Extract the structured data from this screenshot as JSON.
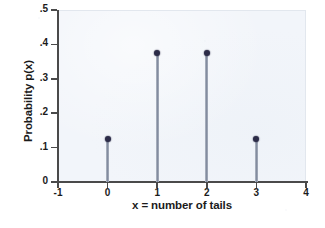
{
  "chart_data": {
    "type": "bar",
    "subtype": "stem-plot",
    "title": "",
    "xlabel": "x = number of tails",
    "ylabel": "Probability p(x)",
    "categories": [
      "0",
      "1",
      "2",
      "3"
    ],
    "x": [
      0,
      1,
      2,
      3
    ],
    "values": [
      0.125,
      0.375,
      0.375,
      0.125
    ],
    "xlim": [
      -1,
      4
    ],
    "ylim": [
      0,
      0.5
    ],
    "xticks": [
      -1,
      0,
      1,
      2,
      3,
      4
    ],
    "xtick_labels": [
      "-1",
      "0",
      "1",
      "2",
      "3",
      "4"
    ],
    "yticks": [
      0,
      0.1,
      0.2,
      0.3,
      0.4,
      0.5
    ],
    "ytick_labels": [
      "0",
      ".1",
      ".2",
      ".3",
      ".4",
      ".5"
    ],
    "grid": false,
    "legend": null,
    "series": [
      {
        "name": "p(x)",
        "values": [
          0.125,
          0.375,
          0.375,
          0.125
        ]
      }
    ],
    "colors": {
      "panel_background": "#f2f5fa",
      "stem": "#8c95a6",
      "marker": "#2c2c48",
      "axis": "#4a4a4a",
      "text": "#1b1b1b",
      "figure_background": "#ffffff"
    }
  }
}
